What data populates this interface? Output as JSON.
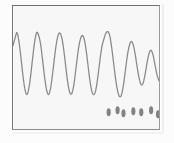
{
  "figure": {
    "background_color": "#fcfcfc",
    "plot_background_color": "#f7f7f7",
    "frame_color": "#8b8b8b",
    "trace_color": "#8a8a8a",
    "trace_marker_color": "#707070"
  },
  "chart_data": {
    "type": "line",
    "title": "",
    "subtitle": "",
    "xlabel": "",
    "ylabel": "",
    "xlim": [
      0,
      148
    ],
    "ylim": [
      0,
      125
    ],
    "grid": false,
    "legend": null,
    "tick_labels_x": [],
    "tick_labels_y": [],
    "axis_visible": true,
    "series": [
      {
        "name": "signal",
        "color": "#8a8a8a",
        "line_width": 1.3,
        "x": [
          0,
          2,
          4,
          6,
          8,
          10,
          12,
          14,
          16,
          18,
          20,
          22,
          24,
          26,
          28,
          30,
          32,
          34,
          36,
          38,
          40,
          42,
          44,
          46,
          48,
          50,
          52,
          54,
          56,
          58,
          60,
          62,
          64,
          66,
          68,
          70,
          72,
          74,
          76,
          78,
          80,
          82,
          84,
          86,
          88,
          90,
          92,
          94,
          96,
          98,
          100,
          102,
          104,
          106,
          108,
          110,
          112,
          114,
          116,
          118,
          120,
          122,
          124,
          126,
          128,
          130,
          132,
          134,
          136,
          138,
          140,
          142,
          144,
          146,
          148
        ],
        "y": [
          40,
          33,
          27,
          36,
          52,
          70,
          84,
          90,
          84,
          70,
          52,
          36,
          27,
          30,
          39,
          55,
          72,
          85,
          90,
          84,
          70,
          53,
          38,
          29,
          28,
          35,
          49,
          66,
          81,
          89,
          88,
          78,
          62,
          46,
          35,
          30,
          33,
          44,
          60,
          76,
          87,
          90,
          85,
          72,
          56,
          42,
          34,
          28,
          26,
          30,
          42,
          58,
          74,
          86,
          92,
          90,
          80,
          65,
          50,
          40,
          36,
          40,
          50,
          63,
          74,
          80,
          78,
          69,
          57,
          48,
          45,
          50,
          60,
          70,
          76
        ]
      }
    ],
    "annotations": []
  },
  "waveform": {
    "left_segment": {
      "label": "high-amplitude burst",
      "cycle_count": 6,
      "peak_y": 28,
      "trough_y": 104,
      "period_px": 16.5,
      "start_x": 2,
      "end_x": 100
    },
    "right_segment": {
      "label": "decayed burst",
      "cycle_count": 6,
      "peak_y": 52,
      "trough_y": 108,
      "period_px": 13.5,
      "start_x": 100,
      "end_x": 148
    },
    "trough_markers": {
      "color": "#6e6e6e",
      "count": 7,
      "positions_x": [
        97,
        106,
        112,
        122,
        130,
        140,
        147
      ],
      "positions_y": [
        108,
        106,
        109,
        107,
        108,
        106,
        110
      ]
    }
  }
}
